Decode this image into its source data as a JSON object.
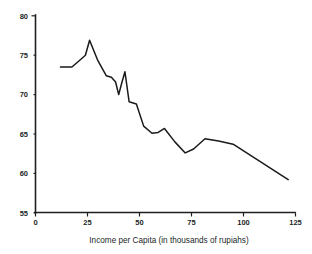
{
  "chart_data": {
    "type": "line",
    "title": "",
    "subtitle": "",
    "xlabel": "Income per Capita (in thousands of rupiahs)",
    "ylabel": "",
    "xlim": [
      0,
      125
    ],
    "ylim": [
      55,
      80
    ],
    "xticks": [
      0,
      25,
      50,
      75,
      100,
      125
    ],
    "yticks": [
      55,
      60,
      65,
      70,
      75,
      80
    ],
    "xticklabels": [
      "0",
      "25",
      "50",
      "75",
      "100",
      "125"
    ],
    "yticklabels": [
      "55",
      "60",
      "65",
      "70",
      "75",
      "80"
    ],
    "grid": false,
    "legend": null,
    "legend_position": "none",
    "line_color": "#1a1a1a",
    "series": [
      {
        "name": "",
        "points": [
          [
            12.0,
            73.5
          ],
          [
            17.5,
            73.5
          ],
          [
            21.0,
            74.3
          ],
          [
            24.0,
            75.0
          ],
          [
            26.0,
            76.9
          ],
          [
            30.0,
            74.3
          ],
          [
            34.0,
            72.4
          ],
          [
            36.5,
            72.2
          ],
          [
            38.5,
            71.6
          ],
          [
            40.0,
            70.0
          ],
          [
            41.5,
            71.5
          ],
          [
            43.0,
            72.9
          ],
          [
            45.0,
            69.1
          ],
          [
            48.5,
            68.8
          ],
          [
            52.0,
            66.0
          ],
          [
            56.0,
            65.1
          ],
          [
            59.0,
            65.2
          ],
          [
            62.0,
            65.7
          ],
          [
            67.0,
            64.0
          ],
          [
            72.0,
            62.6
          ],
          [
            76.0,
            63.1
          ],
          [
            81.5,
            64.4
          ],
          [
            88.0,
            64.1
          ],
          [
            95.0,
            63.7
          ],
          [
            121.5,
            59.2
          ]
        ]
      }
    ]
  },
  "axes": {
    "x_axis_name": "x-axis",
    "y_axis_name": "y-axis"
  }
}
